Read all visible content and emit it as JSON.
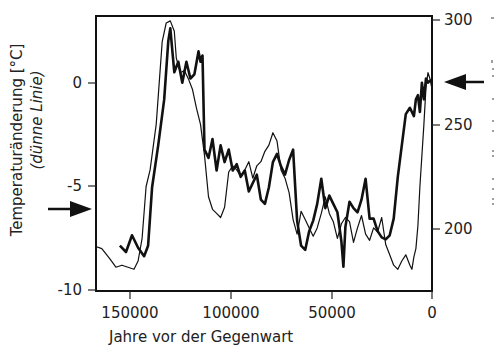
{
  "chart_data": {
    "type": "line",
    "title": "",
    "xlabel": "Jahre vor der Gegenwart",
    "ylabel_left": "Temperaturänderung [°C]",
    "ylabel_left_sub": "(dünne Linie)",
    "ylabel_right": "",
    "x_ticks": [
      "150000",
      "100000",
      "50000",
      "0"
    ],
    "x_tick_values": [
      150000,
      100000,
      50000,
      0
    ],
    "y_left_ticks": [
      "0",
      "-5",
      "-10"
    ],
    "y_left_tick_values": [
      0,
      -5,
      -10
    ],
    "y_right_ticks": [
      "300",
      "250",
      "200"
    ],
    "y_right_tick_values": [
      300,
      250,
      200
    ],
    "xlim": [
      167000,
      0
    ],
    "ylim_left": [
      -10,
      3.2
    ],
    "ylim_right": [
      181,
      302
    ],
    "grid": false,
    "legend": null,
    "annotations": [
      {
        "type": "arrow",
        "side": "left",
        "points_to": "y_left",
        "value": -7.9,
        "note": "arrow pointing right at left axis"
      },
      {
        "type": "arrow",
        "side": "right",
        "points_to": "y_right",
        "value": 270,
        "note": "arrow pointing left at right axis"
      }
    ],
    "series": [
      {
        "name": "Temperaturänderung (dünne Linie)",
        "axis": "left",
        "style": "thin",
        "x": [
          167000,
          164000,
          160000,
          157000,
          154000,
          151000,
          148000,
          146000,
          144000,
          142000,
          140000,
          137000,
          134000,
          132000,
          130000,
          128000,
          127000,
          125000,
          123000,
          121000,
          119000,
          117000,
          115000,
          113000,
          111000,
          109000,
          107000,
          105000,
          103000,
          101000,
          99000,
          97000,
          95000,
          93000,
          91000,
          89000,
          87000,
          85000,
          83000,
          81000,
          79000,
          77000,
          75000,
          73000,
          71000,
          69000,
          67000,
          65000,
          63000,
          61000,
          59000,
          57000,
          55000,
          53000,
          51000,
          49000,
          47000,
          45000,
          43000,
          41000,
          39000,
          37000,
          35000,
          33000,
          31000,
          29000,
          27000,
          25000,
          23000,
          21000,
          19000,
          17000,
          15000,
          13000,
          11000,
          10000,
          9000,
          8000,
          7000,
          6000,
          5000,
          4000,
          3000,
          2000,
          1000,
          0
        ],
        "y": [
          -7.9,
          -8.0,
          -8.5,
          -8.9,
          -8.8,
          -8.9,
          -9.0,
          -8.6,
          -7.5,
          -5.0,
          -4.2,
          -2.0,
          2.0,
          2.9,
          3.0,
          2.5,
          1.2,
          0.5,
          0.6,
          0.2,
          -0.3,
          -1.2,
          -2.0,
          -3.5,
          -5.5,
          -6.1,
          -6.3,
          -6.5,
          -6.0,
          -4.3,
          -4.0,
          -4.2,
          -4.5,
          -4.2,
          -3.8,
          -4.6,
          -4.0,
          -3.8,
          -3.3,
          -3.0,
          -2.4,
          -2.8,
          -4.2,
          -4.6,
          -5.3,
          -6.6,
          -7.3,
          -6.2,
          -6.6,
          -7.0,
          -7.4,
          -7.0,
          -6.3,
          -5.5,
          -6.3,
          -6.7,
          -7.5,
          -6.8,
          -6.5,
          -6.7,
          -7.7,
          -7.0,
          -6.4,
          -7.3,
          -7.6,
          -7.0,
          -7.2,
          -6.5,
          -7.8,
          -8.3,
          -8.8,
          -9.0,
          -8.6,
          -8.3,
          -8.8,
          -9.0,
          -8.4,
          -8.0,
          -6.9,
          -5.0,
          -3.5,
          -2.0,
          -0.2,
          0.5,
          0.2,
          -0.3
        ]
      },
      {
        "name": "CO2-Konzentration (dicke Linie)",
        "axis": "right",
        "style": "thick",
        "x": [
          155000,
          152000,
          149000,
          146000,
          143000,
          141000,
          139000,
          136000,
          133000,
          131000,
          130000,
          128000,
          126000,
          124000,
          122000,
          120000,
          118000,
          116000,
          115000,
          114000,
          113000,
          111000,
          109000,
          107000,
          105000,
          103000,
          101000,
          99000,
          97000,
          95000,
          93000,
          91000,
          89000,
          87000,
          85000,
          83000,
          81000,
          79000,
          77000,
          75000,
          73000,
          71000,
          69000,
          67000,
          65000,
          63000,
          61000,
          59000,
          57000,
          55000,
          53000,
          51000,
          49000,
          47000,
          45000,
          44000,
          43000,
          41000,
          39000,
          37000,
          35000,
          33000,
          31000,
          29000,
          27000,
          25000,
          23000,
          21000,
          19000,
          17000,
          15000,
          13000,
          11000,
          9000,
          8000,
          7000,
          6000,
          5000,
          4000,
          3000,
          2000,
          1000,
          0
        ],
        "y": [
          192,
          189,
          197,
          191,
          187,
          192,
          220,
          240,
          262,
          290,
          296,
          275,
          280,
          270,
          280,
          272,
          274,
          285,
          280,
          283,
          238,
          234,
          243,
          228,
          240,
          232,
          238,
          228,
          231,
          225,
          228,
          218,
          222,
          226,
          214,
          212,
          220,
          232,
          236,
          230,
          226,
          233,
          238,
          204,
          192,
          190,
          199,
          204,
          212,
          224,
          210,
          216,
          212,
          208,
          194,
          182,
          201,
          213,
          210,
          208,
          214,
          224,
          205,
          205,
          199,
          196,
          195,
          197,
          205,
          225,
          240,
          255,
          258,
          254,
          262,
          264,
          256,
          270,
          262,
          272,
          270,
          271,
          271
        ]
      }
    ]
  }
}
